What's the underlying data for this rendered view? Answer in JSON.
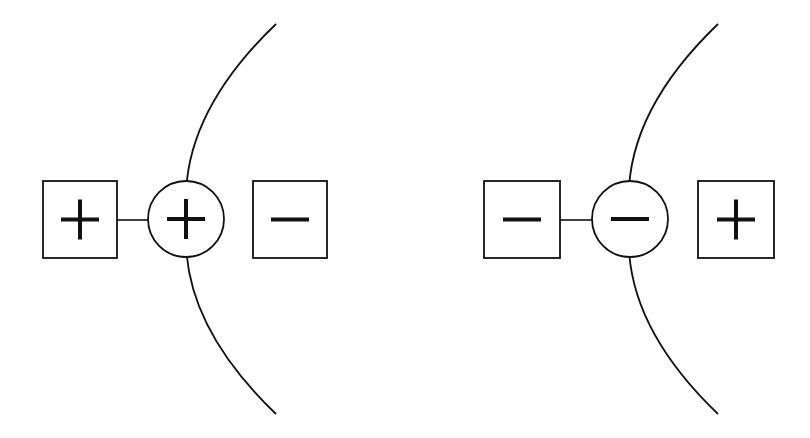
{
  "diagram": {
    "title": "",
    "colors": {
      "stroke": "#111111",
      "background": "#ffffff"
    },
    "panels": [
      {
        "id": "left",
        "arc": {
          "start": [
            276,
            24
          ],
          "control_top": [
            176,
            120
          ],
          "mid": [
            187,
            219
          ],
          "control_bottom": [
            176,
            318
          ],
          "end": [
            276,
            414
          ]
        },
        "outer_box": {
          "x": 43,
          "y": 181,
          "w": 74,
          "h": 77,
          "sign": "+"
        },
        "circle": {
          "cx": 186,
          "cy": 219,
          "r": 38,
          "sign": "+"
        },
        "right_box": {
          "x": 253,
          "y": 181,
          "w": 74,
          "h": 77,
          "sign": "−"
        },
        "connector": {
          "x1": 117,
          "y1": 220,
          "x2": 148,
          "y2": 220
        }
      },
      {
        "id": "right",
        "arc": {
          "start": [
            718,
            24
          ],
          "control_top": [
            618,
            120
          ],
          "mid": [
            630,
            219
          ],
          "control_bottom": [
            618,
            318
          ],
          "end": [
            718,
            414
          ]
        },
        "outer_box": {
          "x": 484,
          "y": 181,
          "w": 76,
          "h": 77,
          "sign": "−"
        },
        "circle": {
          "cx": 630,
          "cy": 219,
          "r": 38,
          "sign": "−"
        },
        "right_box": {
          "x": 698,
          "y": 181,
          "w": 76,
          "h": 77,
          "sign": "+"
        },
        "connector": {
          "x1": 560,
          "y1": 220,
          "x2": 592,
          "y2": 220
        }
      }
    ]
  }
}
